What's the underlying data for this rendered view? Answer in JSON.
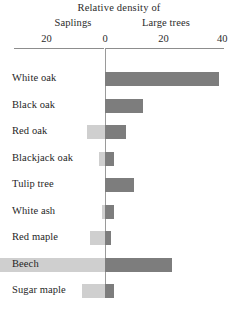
{
  "chart": {
    "title": "Relative density of",
    "group_labels": {
      "left": "Saplings",
      "right": "Large trees"
    }
  },
  "axis": {
    "ticks": [
      {
        "label": "40",
        "value": -40
      },
      {
        "label": "20",
        "value": -20
      },
      {
        "label": "0",
        "value": 0
      },
      {
        "label": "20",
        "value": 20
      },
      {
        "label": "40",
        "value": 40
      }
    ]
  },
  "colors": {
    "saplings": "#cfcfcf",
    "large_trees": "#7d7d7d",
    "axis": "#8d8d8d",
    "text": "#1f1f1f"
  },
  "chart_data": {
    "type": "bar",
    "title": "Relative density of",
    "subtype": "diverging-population-pyramid",
    "orientation": "horizontal",
    "xlabel": "",
    "ylabel": "",
    "xlim": [
      -45,
      40
    ],
    "grid": false,
    "legend_position": "top",
    "categories": [
      "White oak",
      "Black oak",
      "Red oak",
      "Blackjack oak",
      "Tulip tree",
      "White ash",
      "Red maple",
      "Beech",
      "Sugar maple"
    ],
    "series": [
      {
        "name": "Saplings",
        "direction": "left",
        "color": "#cfcfcf",
        "values": [
          0,
          0,
          6,
          2,
          0,
          1,
          5,
          44,
          8
        ]
      },
      {
        "name": "Large trees",
        "direction": "right",
        "color": "#7d7d7d",
        "values": [
          39,
          13,
          7,
          3,
          10,
          3,
          2,
          23,
          3
        ]
      }
    ]
  }
}
